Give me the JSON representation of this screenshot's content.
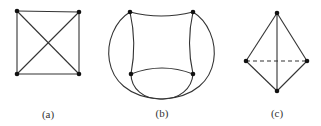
{
  "figures": [
    {
      "id": "a",
      "label": "(a)",
      "description": "Square with both diagonals (K4, planar drawing with crossing)"
    },
    {
      "id": "b",
      "label": "(b)",
      "description": "K4 drawn with curved edges; two outer arcs crossing below"
    },
    {
      "id": "c",
      "label": "(c)",
      "description": "Tetrahedron-like drawing with dashed horizontal edge"
    }
  ],
  "colors": {
    "edge": "#333333",
    "vertex": "#111111",
    "background": "#ffffff"
  }
}
